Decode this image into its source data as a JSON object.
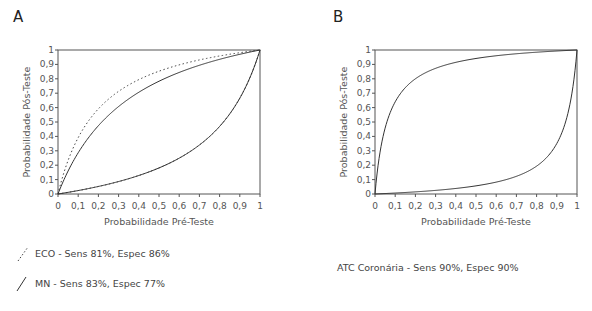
{
  "panels": [
    {
      "label": "A"
    },
    {
      "label": "B"
    }
  ],
  "legend": {
    "A": [
      {
        "style": "dotted",
        "text": "ECO - Sens 81%, Espec 86%"
      },
      {
        "style": "solid",
        "text": "MN - Sens 83%, Espec 77%"
      }
    ],
    "B": [
      {
        "style": "none",
        "text": "ATC Coronária - Sens 90%, Espec 90%"
      }
    ]
  },
  "colors": {
    "line": "#333333",
    "axis": "#555555",
    "dotted": "#444444"
  },
  "chart_data": [
    {
      "type": "line",
      "title": "A",
      "xlabel": "Probabilidade Pré-Teste",
      "ylabel": "Probabilidade Pós-Teste",
      "xlim": [
        0,
        1
      ],
      "ylim": [
        0,
        1
      ],
      "xticks": [
        "0",
        "0,1",
        "0,2",
        "0,3",
        "0,4",
        "0,5",
        "0,6",
        "0,7",
        "0,8",
        "0,9",
        "1"
      ],
      "yticks": [
        "0",
        "0,1",
        "0,2",
        "0,3",
        "0,4",
        "0,5",
        "0,6",
        "0,7",
        "0,8",
        "0,9",
        "1"
      ],
      "grid": false,
      "series": [
        {
          "name": "ECO - Sens 81%, Espec 86% (teste positivo)",
          "style": "dotted",
          "lr": 5.79,
          "x": [
            0,
            0.1,
            0.2,
            0.3,
            0.4,
            0.5,
            0.6,
            0.7,
            0.8,
            0.9,
            1
          ],
          "values": [
            0,
            0.39,
            0.59,
            0.71,
            0.79,
            0.85,
            0.9,
            0.93,
            0.96,
            0.98,
            1
          ]
        },
        {
          "name": "ECO - Sens 81%, Espec 86% (teste negativo)",
          "style": "dotted",
          "lr": 0.221,
          "x": [
            0,
            0.1,
            0.2,
            0.3,
            0.4,
            0.5,
            0.6,
            0.7,
            0.8,
            0.9,
            1
          ],
          "values": [
            0,
            0.02,
            0.05,
            0.09,
            0.13,
            0.18,
            0.25,
            0.34,
            0.47,
            0.67,
            1
          ]
        },
        {
          "name": "MN - Sens 83%, Espec 77% (teste positivo)",
          "style": "solid",
          "lr": 3.61,
          "x": [
            0,
            0.1,
            0.2,
            0.3,
            0.4,
            0.5,
            0.6,
            0.7,
            0.8,
            0.9,
            1
          ],
          "values": [
            0,
            0.29,
            0.47,
            0.61,
            0.71,
            0.78,
            0.84,
            0.89,
            0.94,
            0.97,
            1
          ]
        },
        {
          "name": "MN - Sens 83%, Espec 77% (teste negativo)",
          "style": "solid",
          "lr": 0.221,
          "x": [
            0,
            0.1,
            0.2,
            0.3,
            0.4,
            0.5,
            0.6,
            0.7,
            0.8,
            0.9,
            1
          ],
          "values": [
            0,
            0.02,
            0.05,
            0.09,
            0.13,
            0.18,
            0.25,
            0.34,
            0.47,
            0.67,
            1
          ]
        }
      ]
    },
    {
      "type": "line",
      "title": "B",
      "xlabel": "Probabilidade Pré-Teste",
      "ylabel": "Probabilidade Pós-Teste",
      "xlim": [
        0,
        1
      ],
      "ylim": [
        0,
        1
      ],
      "xticks": [
        "0",
        "0,1",
        "0,2",
        "0,3",
        "0,4",
        "0,5",
        "0,6",
        "0,7",
        "0,8",
        "0,9",
        "1"
      ],
      "yticks": [
        "0",
        "0,1",
        "0,2",
        "0,3",
        "0,4",
        "0,5",
        "0,6",
        "0,7",
        "0,8",
        "0,9",
        "1"
      ],
      "grid": false,
      "series": [
        {
          "name": "ATC Coronária - Sens 90%, Espec 90% (teste positivo)",
          "style": "solid",
          "lr": 16,
          "x": [
            0,
            0.1,
            0.2,
            0.3,
            0.4,
            0.5,
            0.6,
            0.7,
            0.8,
            0.9,
            1
          ],
          "values": [
            0,
            0.64,
            0.8,
            0.87,
            0.91,
            0.94,
            0.96,
            0.97,
            0.98,
            0.99,
            1
          ]
        },
        {
          "name": "ATC Coronária - Sens 90%, Espec 90% (teste negativo)",
          "style": "solid",
          "lr": 0.06,
          "x": [
            0,
            0.1,
            0.2,
            0.3,
            0.4,
            0.5,
            0.6,
            0.7,
            0.8,
            0.9,
            1
          ],
          "values": [
            0,
            0.01,
            0.01,
            0.03,
            0.04,
            0.06,
            0.08,
            0.12,
            0.19,
            0.35,
            1
          ]
        }
      ]
    }
  ]
}
